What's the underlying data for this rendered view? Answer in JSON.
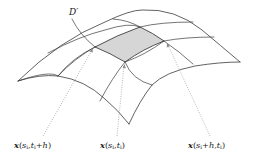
{
  "figure": {
    "type": "parametric-surface-diagram",
    "surface_label": "D′",
    "shaded_patch": {
      "fill": "#d6d6d6",
      "corners": [
        "x(s_i,t_i)",
        "x(s_i,t_i+h)",
        "x(s_i+h,t_i+h)",
        "x(s_i+h,t_i)"
      ]
    },
    "labels": [
      {
        "id": "left",
        "vector": "x",
        "args": "s",
        "sub1": "i",
        "sep": ",",
        "t": "t",
        "sub2": "i",
        "tail": "+h",
        "close": ")",
        "text": "x(s_i, t_i + h)"
      },
      {
        "id": "center",
        "vector": "x",
        "args": "s",
        "sub1": "i",
        "sep": ",",
        "t": "t",
        "sub2": "i",
        "tail": "",
        "close": ")",
        "text": "x(s_i, t_i)"
      },
      {
        "id": "right",
        "vector": "x",
        "args": "s",
        "sub1": "i",
        "sep": "+h,",
        "t": "t",
        "sub2": "i",
        "tail": "",
        "close": ")",
        "text": "x(s_i + h, t_i)"
      }
    ],
    "colors": {
      "line": "#3a3a3a",
      "pointer": "#8a8a8a",
      "patch": "#d6d6d6",
      "background": "#ffffff"
    }
  }
}
